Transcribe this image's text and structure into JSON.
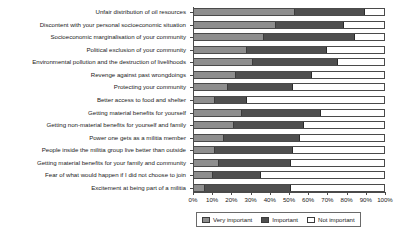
{
  "chart_data": {
    "type": "bar",
    "orientation": "horizontal",
    "stacked": true,
    "stack_mode": "percent",
    "title": "",
    "xlabel": "",
    "ylabel": "",
    "xlim": [
      0,
      100
    ],
    "grid": false,
    "legend_position": "bottom",
    "x_tick_labels": [
      "0%",
      "10%",
      "20%",
      "30%",
      "40%",
      "50%",
      "60%",
      "70%",
      "80%",
      "90%",
      "100%"
    ],
    "x_tick_values": [
      0,
      10,
      20,
      30,
      40,
      50,
      60,
      70,
      80,
      90,
      100
    ],
    "categories": [
      "Unfair distribution of oil resources",
      "Discontent with your personal socioeconomic situation",
      "Socioeconomic marginalisation of your community",
      "Political exclusion of your community",
      "Environmental pollution and the destruction of livelihoods",
      "Revenge against past wrongdoings",
      "Protecting your community",
      "Better access to food and shelter",
      "Getting material benefits for yourself",
      "Getting non-material benefits for yourself and family",
      "Power one gets as a militia member",
      "People inside the militia group live better than outside",
      "Getting material benefits for your family and community",
      "Fear of what would happen if I did not choose to join",
      "Excitement at being part of a militia"
    ],
    "series": [
      {
        "name": "Very important",
        "color": "#8e8e8e",
        "values": [
          53,
          43,
          37,
          28,
          31,
          22,
          18,
          11,
          25,
          21,
          16,
          11,
          13,
          10,
          6
        ]
      },
      {
        "name": "Important",
        "color": "#4f4f4f",
        "values": [
          37,
          36,
          48,
          42,
          45,
          40,
          34,
          17,
          42,
          37,
          40,
          41,
          38,
          25,
          45
        ]
      },
      {
        "name": "Not important",
        "color": "#ffffff",
        "values": [
          10,
          21,
          15,
          30,
          24,
          38,
          48,
          72,
          33,
          42,
          44,
          48,
          49,
          65,
          49
        ]
      }
    ],
    "legend": [
      {
        "label": "Very important",
        "swatch": "sw-very"
      },
      {
        "label": "Important",
        "swatch": "sw-imp"
      },
      {
        "label": "Not important",
        "swatch": "sw-not"
      }
    ]
  }
}
